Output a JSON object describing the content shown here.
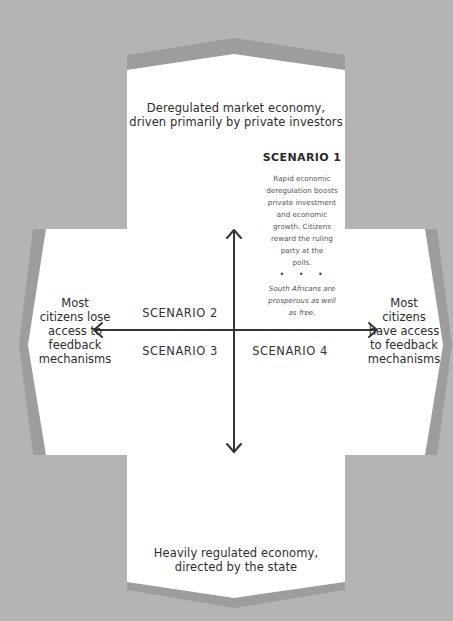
{
  "colors": {
    "background": "#b4b4b4",
    "band": "#9d9d9d",
    "panel": "#ffffff",
    "axis": "#333333"
  },
  "axes": {
    "top_label": "Deregulated market economy, driven primarily by private investors",
    "top_label_lines": [
      "Deregulated market economy,",
      "driven primarily by private investors"
    ],
    "bottom_label_lines": [
      "Heavily regulated economy,",
      "directed by the state"
    ],
    "left_label_lines": [
      "Most",
      "citizens lose",
      "access to",
      "feedback",
      "mechanisms"
    ],
    "right_label_lines": [
      "Most",
      "citizens",
      "have access",
      "to feedback",
      "mechanisms"
    ]
  },
  "scenarios": [
    {
      "title": "SCENARIO 1",
      "description_lines": [
        "Rapid economic",
        "deregulation boosts",
        "private investment",
        "and economic",
        "growth. Citizens",
        "reward the ruling",
        "party at the",
        "polls."
      ],
      "separator": "• • •",
      "outcome_lines": [
        "South Africans are",
        "prosperous as well",
        "as free."
      ]
    },
    {
      "title": "SCENARIO 2"
    },
    {
      "title": "SCENARIO 3"
    },
    {
      "title": "SCENARIO 4"
    }
  ]
}
